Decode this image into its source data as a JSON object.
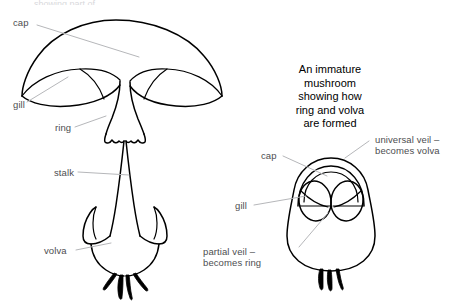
{
  "figure": {
    "title_trimmed": "showing part of",
    "background_color": "#ffffff",
    "ink_color": "#000000",
    "leader_color": "#b6b7ba",
    "label_text_color": "#4d4e50",
    "caption_text_color": "#000000"
  },
  "caption": {
    "text": "An immature\nmushroom\nshowing how\nring and volva\nare formed"
  },
  "mature_mushroom": {
    "name": "mature mushroom diagram",
    "labels": {
      "cap": "cap",
      "gill": "gill",
      "ring": "ring",
      "stalk": "stalk",
      "volva": "volva"
    }
  },
  "immature_mushroom": {
    "name": "immature mushroom diagram",
    "labels": {
      "cap": "cap",
      "gill": "gill",
      "universal_veil": "universal veil –\nbecomes volva",
      "partial_veil": "partial veil –\nbecomes ring"
    }
  }
}
